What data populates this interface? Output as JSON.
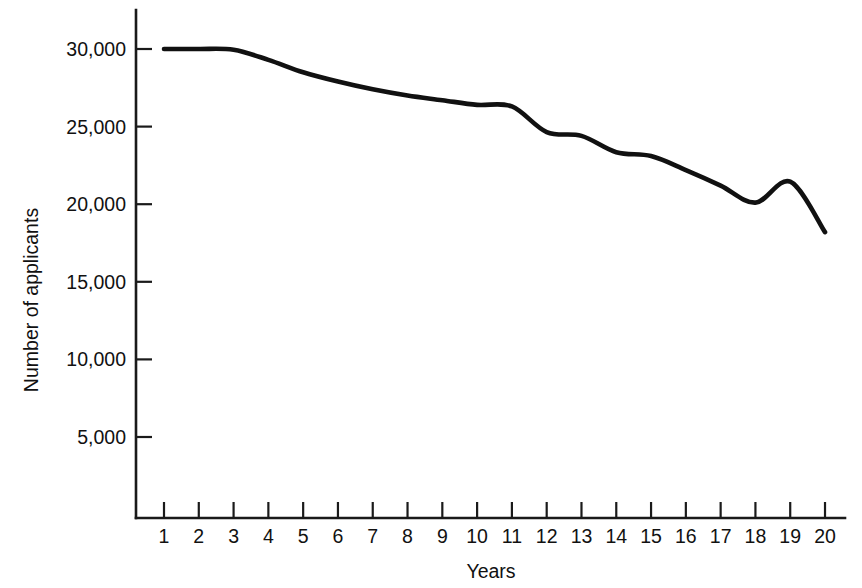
{
  "chart_data": {
    "type": "line",
    "title": "",
    "xlabel": "Years",
    "ylabel": "Number of applicants",
    "xlim": [
      0.4,
      20.6
    ],
    "ylim": [
      0,
      31500
    ],
    "grid": false,
    "legend": false,
    "legend_position": "none",
    "line_color": "#111111",
    "axis_color": "#1a1a1a",
    "background_color": "#ffffff",
    "x_tick_labels": [
      "1",
      "2",
      "3",
      "4",
      "5",
      "6",
      "7",
      "8",
      "9",
      "10",
      "11",
      "12",
      "13",
      "14",
      "15",
      "16",
      "17",
      "18",
      "19",
      "20"
    ],
    "y_tick_labels": [
      "5,000",
      "10,000",
      "15,000",
      "20,000",
      "25,000",
      "30,000"
    ],
    "y_tick_values": [
      5000,
      10000,
      15000,
      20000,
      25000,
      30000
    ],
    "x": [
      1,
      2,
      3,
      4,
      5,
      6,
      7,
      8,
      9,
      10,
      11,
      12,
      13,
      14,
      15,
      16,
      17,
      18,
      19,
      20
    ],
    "values": [
      30000,
      30000,
      29950,
      29300,
      28500,
      27900,
      27400,
      27000,
      26700,
      26400,
      26300,
      24650,
      24400,
      23350,
      23100,
      22200,
      21200,
      20100,
      21450,
      18200
    ],
    "series": [
      {
        "name": "Number of applicants",
        "values": [
          30000,
          30000,
          29950,
          29300,
          28500,
          27900,
          27400,
          27000,
          26700,
          26400,
          26300,
          24650,
          24400,
          23350,
          23100,
          22200,
          21200,
          20100,
          21450,
          18200
        ]
      }
    ]
  }
}
